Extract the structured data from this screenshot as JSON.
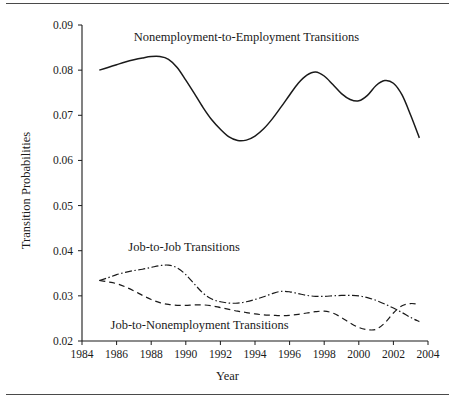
{
  "figure": {
    "xlabel": "Year",
    "ylabel": "Transition Probabilities"
  },
  "annotations": {
    "ne_to_e": "Nonemployment-to-Employment Transitions",
    "job_to_job": "Job-to-Job Transitions",
    "job_to_ne": "Job-to-Nonemployment Transitions"
  },
  "axis": {
    "y_ticks": [
      "0.09",
      "0.08",
      "0.07",
      "0.06",
      "0.05",
      "0.04",
      "0.03",
      "0.02"
    ],
    "x_ticks": [
      "1984",
      "1986",
      "1988",
      "1990",
      "1992",
      "1994",
      "1996",
      "1998",
      "2000",
      "2002",
      "2004"
    ]
  },
  "colors": {
    "ink": "#1a1a1a",
    "rule": "#4a4a4a",
    "background": "#ffffff"
  },
  "chart_data": {
    "type": "line",
    "title": "",
    "subtitle": "",
    "xlabel": "Year",
    "ylabel": "Transition Probabilities",
    "xlim": [
      1984,
      2004
    ],
    "ylim": [
      0.02,
      0.09
    ],
    "x_ticks": [
      1984,
      1986,
      1988,
      1990,
      1992,
      1994,
      1996,
      1998,
      2000,
      2002,
      2004
    ],
    "y_ticks": [
      0.02,
      0.03,
      0.04,
      0.05,
      0.06,
      0.07,
      0.08,
      0.09
    ],
    "grid": false,
    "legend": "inline-annotations",
    "x": [
      1985.0,
      1985.5,
      1986.0,
      1986.5,
      1987.0,
      1987.5,
      1988.0,
      1988.5,
      1989.0,
      1989.5,
      1990.0,
      1990.5,
      1991.0,
      1991.5,
      1992.0,
      1992.5,
      1993.0,
      1993.5,
      1994.0,
      1994.5,
      1995.0,
      1995.5,
      1996.0,
      1996.5,
      1997.0,
      1997.5,
      1998.0,
      1998.5,
      1999.0,
      1999.5,
      2000.0,
      2000.5,
      2001.0,
      2001.5,
      2002.0,
      2002.5,
      2003.0,
      2003.5
    ],
    "series": [
      {
        "name": "Nonemployment-to-Employment Transitions",
        "style": "solid",
        "values": [
          0.08,
          0.0806,
          0.0812,
          0.0818,
          0.0823,
          0.0827,
          0.083,
          0.083,
          0.0824,
          0.0806,
          0.0778,
          0.0748,
          0.0717,
          0.069,
          0.0669,
          0.0652,
          0.0644,
          0.0645,
          0.0654,
          0.067,
          0.0692,
          0.0718,
          0.0745,
          0.0771,
          0.0789,
          0.0796,
          0.0787,
          0.0768,
          0.0748,
          0.0735,
          0.0732,
          0.0744,
          0.0766,
          0.0777,
          0.0771,
          0.0745,
          0.07,
          0.065
        ]
      },
      {
        "name": "Job-to-Job Transitions",
        "style": "dash-dot",
        "values": [
          0.0334,
          0.034,
          0.0347,
          0.0352,
          0.0356,
          0.0359,
          0.0363,
          0.0367,
          0.0368,
          0.0362,
          0.0347,
          0.0326,
          0.0306,
          0.0293,
          0.0287,
          0.0284,
          0.0284,
          0.0287,
          0.0292,
          0.0298,
          0.0305,
          0.031,
          0.0309,
          0.0305,
          0.0301,
          0.0299,
          0.0299,
          0.03,
          0.0301,
          0.0301,
          0.03,
          0.0296,
          0.029,
          0.0282,
          0.0273,
          0.0263,
          0.0252,
          0.0243
        ]
      },
      {
        "name": "Job-to-Nonemployment Transitions",
        "style": "dashed",
        "values": [
          0.0334,
          0.0331,
          0.0327,
          0.032,
          0.0311,
          0.0301,
          0.0292,
          0.0285,
          0.0281,
          0.0279,
          0.0279,
          0.028,
          0.028,
          0.0278,
          0.0274,
          0.027,
          0.0266,
          0.0263,
          0.026,
          0.0258,
          0.0257,
          0.0256,
          0.0257,
          0.0259,
          0.0262,
          0.0265,
          0.0266,
          0.0262,
          0.0252,
          0.024,
          0.023,
          0.0225,
          0.0226,
          0.024,
          0.0262,
          0.0278,
          0.0283,
          0.0281
        ]
      }
    ],
    "annotations": [
      {
        "text": "Nonemployment-to-Employment Transitions",
        "x": 1993.5,
        "y": 0.0865
      },
      {
        "text": "Job-to-Job Transitions",
        "x": 1989.9,
        "y": 0.0399
      },
      {
        "text": "Job-to-Nonemployment Transitions",
        "x": 1990.8,
        "y": 0.0227
      }
    ]
  }
}
